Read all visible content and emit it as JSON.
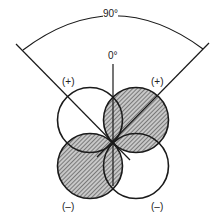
{
  "diagram": {
    "angle_label": "90°",
    "zero_label": "0°",
    "lobes": [
      {
        "position": "upper-left",
        "sign": "(+)",
        "shaded": false
      },
      {
        "position": "upper-right",
        "sign": "(+)",
        "shaded": true
      },
      {
        "position": "lower-left",
        "sign": "(–)",
        "shaded": true
      },
      {
        "position": "lower-right",
        "sign": "(–)",
        "shaded": false
      }
    ],
    "colors": {
      "line": "#1a1a1a",
      "hatch": "#555555",
      "hatch_bg": "#bdbdbd"
    }
  }
}
